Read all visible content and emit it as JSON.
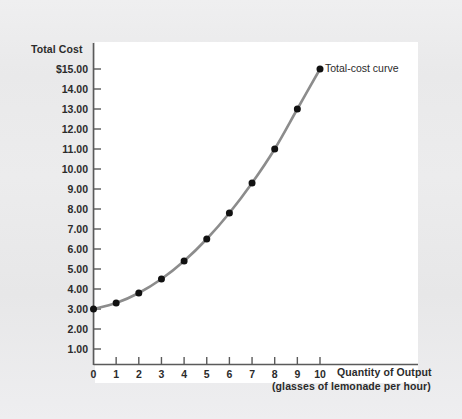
{
  "figure": {
    "background_color": "#ececed",
    "plot_background_color": "#ffffff"
  },
  "chart_data": {
    "type": "line",
    "title": "",
    "subtitle": "",
    "ylabel": "Total Cost",
    "xlabel": "Quantity of Output",
    "xlabel_sub": "(glasses of lemonade per hour)",
    "x": [
      0,
      1,
      2,
      3,
      4,
      5,
      6,
      7,
      8,
      9,
      10
    ],
    "series": [
      {
        "name": "Total-cost curve",
        "values": [
          3.0,
          3.3,
          3.8,
          4.5,
          5.4,
          6.5,
          7.8,
          9.3,
          11.0,
          13.0,
          15.0
        ],
        "line_color": "#8c8c8c",
        "marker_color": "#111111",
        "marker": "circle"
      }
    ],
    "xlim": [
      0,
      10
    ],
    "ylim": [
      0.15,
      15.0
    ],
    "xticks": [
      "0",
      "1",
      "2",
      "3",
      "4",
      "5",
      "6",
      "7",
      "8",
      "9",
      "10"
    ],
    "ytick_values": [
      15,
      14,
      13,
      12,
      11,
      10,
      9,
      8,
      7,
      6,
      5,
      4,
      3,
      2,
      1
    ],
    "yticks": [
      "$15.00",
      "14.00",
      "13.00",
      "12.00",
      "11.00",
      "10.00",
      "9.00",
      "8.00",
      "7.00",
      "6.00",
      "5.00",
      "4.00",
      "3.00",
      "2.00",
      "1.00"
    ],
    "grid": false,
    "legend_position": "inline-annotation",
    "annotations": [
      {
        "text": "Total-cost curve",
        "at_x": 10,
        "at_y": 15.0
      }
    ]
  }
}
